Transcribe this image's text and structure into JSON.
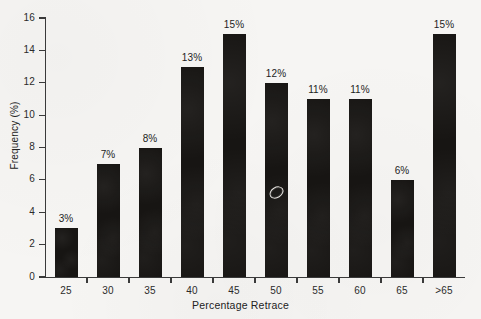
{
  "chart_data": {
    "type": "bar",
    "title": "",
    "subtitle": "",
    "xlabel": "Percentage Retrace",
    "ylabel": "Frequency (%)",
    "categories": [
      "25",
      "30",
      "35",
      "40",
      "45",
      "50",
      "55",
      "60",
      "65",
      ">65"
    ],
    "values": [
      3,
      7,
      8,
      13,
      15,
      12,
      11,
      11,
      6,
      15
    ],
    "data_labels": [
      "3%",
      "7%",
      "8%",
      "13%",
      "15%",
      "12%",
      "11%",
      "11%",
      "6%",
      "15%"
    ],
    "ylim": [
      0,
      16
    ],
    "y_ticks": [
      "0",
      "2",
      "4",
      "6",
      "8",
      "10",
      "12",
      "14",
      "16"
    ],
    "y_tick_values": [
      0,
      2,
      4,
      6,
      8,
      10,
      12,
      14,
      16
    ],
    "grid": false,
    "legend": null,
    "legend_position": "none",
    "bar_color": "#171513",
    "axis_color": "#3a3a3a",
    "background_color": "#f6f5f3",
    "annotations": [
      {
        "name": "scan-blemish",
        "description": "small white ellipse scanning artifact on the 50 bar",
        "category": "50",
        "value_position": 5.3
      }
    ]
  }
}
